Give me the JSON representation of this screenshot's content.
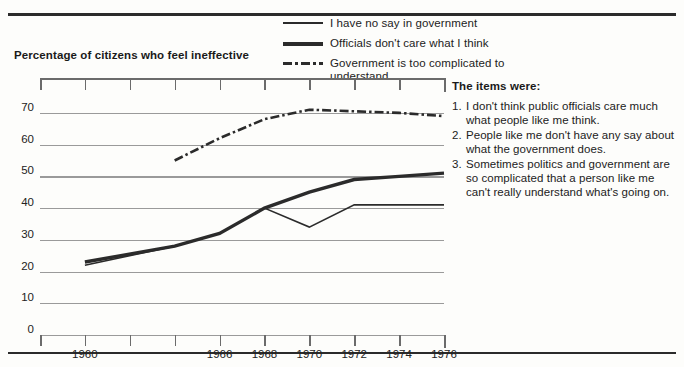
{
  "chart_data": {
    "type": "line",
    "title": "Percentage of citizens who feel ineffective",
    "xlabel": "",
    "ylabel": "",
    "xlim": [
      1958,
      1976
    ],
    "ylim": [
      0,
      75
    ],
    "grid": true,
    "legend_position": "top-right",
    "y_ticks": [
      0,
      10,
      20,
      30,
      40,
      50,
      60,
      70
    ],
    "x_ticks": [
      1958,
      1960,
      1962,
      1964,
      1966,
      1968,
      1970,
      1972,
      1974,
      1976
    ],
    "x_tick_labels": [
      "",
      "1960",
      "",
      "",
      "1966",
      "1968",
      "1970",
      "1972",
      "1974",
      "1976"
    ],
    "series": [
      {
        "name": "I have no say in government",
        "style": "solid-thin",
        "x": [
          1960,
          1964,
          1966,
          1968,
          1970,
          1972,
          1974,
          1976
        ],
        "values": [
          22,
          28,
          32,
          40,
          34,
          41,
          41,
          41
        ]
      },
      {
        "name": "Officials don't care what I think",
        "style": "solid-thick",
        "x": [
          1960,
          1964,
          1966,
          1968,
          1970,
          1972,
          1974,
          1976
        ],
        "values": [
          23,
          28,
          32,
          40,
          45,
          49,
          50,
          51
        ]
      },
      {
        "name": "Government is too complicated to understand",
        "style": "dash-dot",
        "x": [
          1964,
          1966,
          1968,
          1970,
          1972,
          1974,
          1976
        ],
        "values": [
          55,
          62,
          68,
          71,
          70.5,
          70,
          69
        ]
      }
    ]
  },
  "legend": {
    "entries": [
      {
        "label": "I have no say in government",
        "swatch": "solid-thin"
      },
      {
        "label": "Officials don't care what I think",
        "swatch": "solid-thick"
      },
      {
        "label": "Government is too complicated to understand",
        "swatch": "dash-dot"
      }
    ]
  },
  "items_panel": {
    "title": "The items were:",
    "items": [
      {
        "num": "1.",
        "text": "I don't think public officials care much what people like me think."
      },
      {
        "num": "2.",
        "text": "People like me don't have any say about what the government does."
      },
      {
        "num": "3.",
        "text": "Sometimes politics and government are so complicated that a person like me can't really understand what's going on."
      }
    ]
  },
  "colors": {
    "ink": "#2b2b2b",
    "grid": "#9a9a9a",
    "background": "#fdfdfb"
  }
}
